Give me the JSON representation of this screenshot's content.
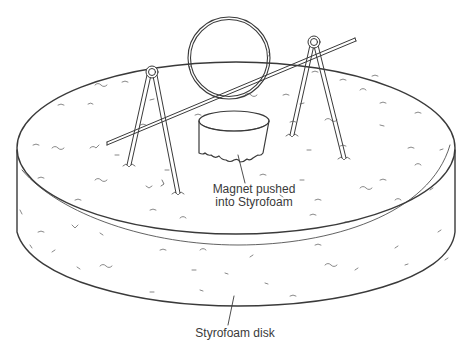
{
  "figure": {
    "type": "line-art illustration",
    "stroke_color": "#3a3a3a",
    "background": "#ffffff"
  },
  "labels": {
    "magnet_line1": "Magnet pushed",
    "magnet_line2": "into Styrofoam",
    "disk": "Styrofoam disk"
  },
  "parts": [
    {
      "name": "styrofoam-disk",
      "description": "flat cylindrical disk with speckled foam texture"
    },
    {
      "name": "magnet",
      "description": "short cylinder pressed into top surface of disk"
    },
    {
      "name": "wire-ring",
      "description": "circular wire loop suspended on horizontal wire"
    },
    {
      "name": "horizontal-wire",
      "description": "straight wire axle passing through ring"
    },
    {
      "name": "left-support",
      "description": "bent wire hairpin with eye loop, legs stuck in disk"
    },
    {
      "name": "right-support",
      "description": "bent wire hairpin with eye loop, legs stuck in disk"
    }
  ]
}
